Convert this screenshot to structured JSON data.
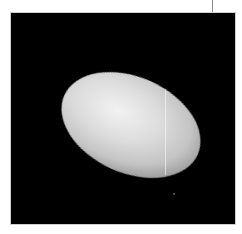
{
  "image": {
    "subject": "elongated-moon",
    "background_color": "#000000",
    "frame_color": "#ffffff",
    "body_highlight_color": "#f2f2f2",
    "body_shadow_color": "#3a3a3a"
  }
}
